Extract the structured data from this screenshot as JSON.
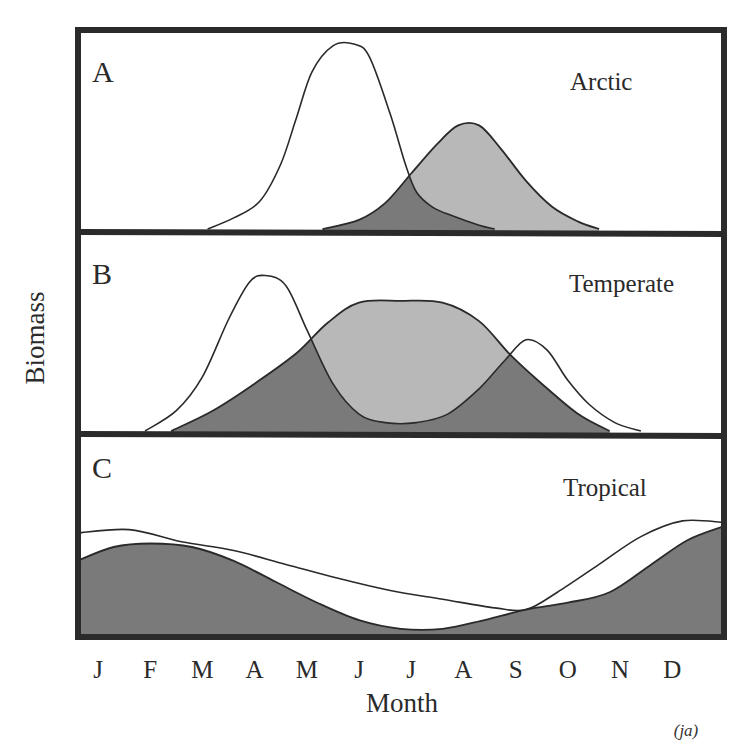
{
  "chart_data": {
    "type": "area",
    "title": "",
    "xlabel": "Month",
    "ylabel": "Biomass",
    "categories": [
      "J",
      "F",
      "M",
      "A",
      "M",
      "J",
      "J",
      "A",
      "S",
      "O",
      "N",
      "D"
    ],
    "x_range_months": [
      -0.4,
      12.0
    ],
    "y_range": [
      0,
      1
    ],
    "grid": false,
    "legend": "none",
    "annotation": "(ja)",
    "series_note": "x in month index (0 = Jan ... 11 = Dec), y = relative biomass (0-1 per panel). Phytoplankton = white curve; zooplankton = shaded curve.",
    "panels": [
      {
        "id": "A",
        "letter": "A",
        "name": "Arctic",
        "series": [
          {
            "name": "Phytoplankton",
            "style": "outline",
            "x": [
              2.1,
              2.6,
              3.1,
              3.5,
              3.8,
              4.1,
              4.5,
              4.9,
              5.2,
              5.6,
              5.9,
              6.1,
              6.4,
              6.8,
              7.3,
              7.6
            ],
            "y": [
              0.0,
              0.06,
              0.15,
              0.35,
              0.6,
              0.85,
              0.99,
              1.0,
              0.93,
              0.62,
              0.34,
              0.2,
              0.12,
              0.07,
              0.02,
              0.0
            ]
          },
          {
            "name": "Zooplankton",
            "style": "shaded",
            "x": [
              4.3,
              5.0,
              5.5,
              6.0,
              6.5,
              6.9,
              7.3,
              7.7,
              8.2,
              8.7,
              9.2,
              9.6
            ],
            "y": [
              0.0,
              0.05,
              0.14,
              0.3,
              0.46,
              0.56,
              0.56,
              0.44,
              0.26,
              0.12,
              0.04,
              0.0
            ]
          }
        ]
      },
      {
        "id": "B",
        "letter": "B",
        "name": "Temperate",
        "series": [
          {
            "name": "Phytoplankton",
            "style": "outline",
            "x": [
              0.9,
              1.5,
              2.0,
              2.5,
              2.9,
              3.2,
              3.6,
              4.0,
              4.5,
              5.0,
              5.5,
              6.1,
              6.7,
              7.3,
              7.8,
              8.2,
              8.6,
              9.0,
              9.4,
              9.9,
              10.4
            ],
            "y": [
              0.0,
              0.12,
              0.32,
              0.66,
              0.88,
              0.92,
              0.86,
              0.6,
              0.28,
              0.1,
              0.05,
              0.05,
              0.1,
              0.25,
              0.42,
              0.54,
              0.48,
              0.3,
              0.16,
              0.05,
              0.0
            ]
          },
          {
            "name": "Zooplankton",
            "style": "shaded",
            "x": [
              1.4,
              2.2,
              3.0,
              3.8,
              4.4,
              5.0,
              5.8,
              6.6,
              7.3,
              7.9,
              8.5,
              9.2,
              9.8
            ],
            "y": [
              0.0,
              0.12,
              0.28,
              0.46,
              0.64,
              0.76,
              0.77,
              0.76,
              0.65,
              0.45,
              0.28,
              0.1,
              0.0
            ]
          }
        ]
      },
      {
        "id": "C",
        "letter": "C",
        "name": "Tropical",
        "series": [
          {
            "name": "Phytoplankton",
            "style": "outline",
            "x": [
              -0.4,
              0.6,
              1.6,
              2.6,
              3.6,
              4.6,
              5.6,
              6.6,
              7.6,
              8.2,
              8.8,
              9.6,
              10.4,
              11.2,
              12.0
            ],
            "y": [
              0.58,
              0.6,
              0.53,
              0.48,
              0.4,
              0.32,
              0.25,
              0.2,
              0.15,
              0.14,
              0.24,
              0.4,
              0.56,
              0.65,
              0.64
            ]
          },
          {
            "name": "Zooplankton",
            "style": "shaded",
            "x": [
              -0.4,
              0.3,
              1.0,
              1.8,
              2.6,
              3.4,
              4.2,
              5.0,
              5.8,
              6.6,
              7.4,
              8.2,
              9.0,
              9.8,
              10.6,
              11.3,
              12.0
            ],
            "y": [
              0.42,
              0.5,
              0.52,
              0.5,
              0.42,
              0.3,
              0.18,
              0.08,
              0.03,
              0.03,
              0.08,
              0.14,
              0.18,
              0.24,
              0.4,
              0.54,
              0.62
            ]
          }
        ]
      }
    ]
  },
  "colors": {
    "frame": "#2b2b2b",
    "outline_fill": "#ffffff",
    "shaded_fill": "#b8b8b8",
    "overlap_fill": "#7a7a7a",
    "stroke": "#2a2a2a"
  }
}
